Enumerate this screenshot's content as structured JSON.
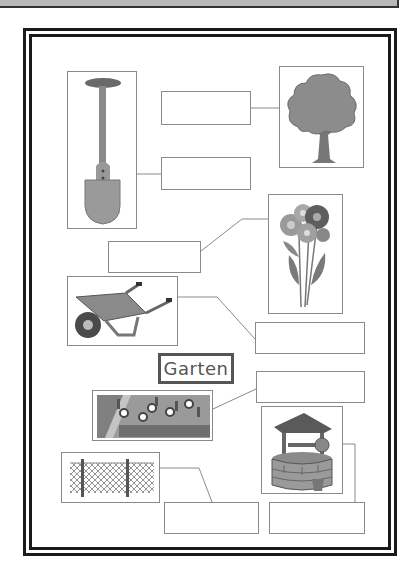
{
  "worksheet": {
    "center_label": "Garten",
    "pictures": [
      {
        "id": "shovel",
        "icon": "shovel-icon",
        "x": 67,
        "y": 71,
        "w": 70,
        "h": 158
      },
      {
        "id": "tree",
        "icon": "tree-icon",
        "x": 279,
        "y": 66,
        "w": 85,
        "h": 102
      },
      {
        "id": "flowers",
        "icon": "flower-bouquet-icon",
        "x": 268,
        "y": 194,
        "w": 75,
        "h": 120
      },
      {
        "id": "wheelbarrow",
        "icon": "wheelbarrow-icon",
        "x": 67,
        "y": 276,
        "w": 111,
        "h": 70
      },
      {
        "id": "flowerbed",
        "icon": "flowerbed-icon",
        "x": 92,
        "y": 390,
        "w": 121,
        "h": 51
      },
      {
        "id": "well",
        "icon": "well-icon",
        "x": 261,
        "y": 406,
        "w": 82,
        "h": 88
      },
      {
        "id": "fence",
        "icon": "fence-icon",
        "x": 61,
        "y": 452,
        "w": 99,
        "h": 51
      }
    ],
    "answer_boxes": [
      {
        "for": "tree",
        "value": "",
        "x": 161,
        "y": 91,
        "w": 90,
        "h": 34
      },
      {
        "for": "shovel",
        "value": "",
        "x": 161,
        "y": 157,
        "w": 90,
        "h": 33
      },
      {
        "for": "flowers",
        "value": "",
        "x": 108,
        "y": 241,
        "w": 93,
        "h": 32
      },
      {
        "for": "wheelbarrow",
        "value": "",
        "x": 255,
        "y": 322,
        "w": 110,
        "h": 32
      },
      {
        "for": "flowerbed",
        "value": "",
        "x": 256,
        "y": 371,
        "w": 109,
        "h": 32
      },
      {
        "for": "fence",
        "value": "",
        "x": 164,
        "y": 502,
        "w": 95,
        "h": 32
      },
      {
        "for": "well",
        "value": "",
        "x": 269,
        "y": 502,
        "w": 96,
        "h": 32
      }
    ],
    "colors": {
      "frame": "#1a1a1a",
      "line": "#8a8a8a",
      "label": "#555555",
      "topbar": "#b8b8b8"
    }
  }
}
